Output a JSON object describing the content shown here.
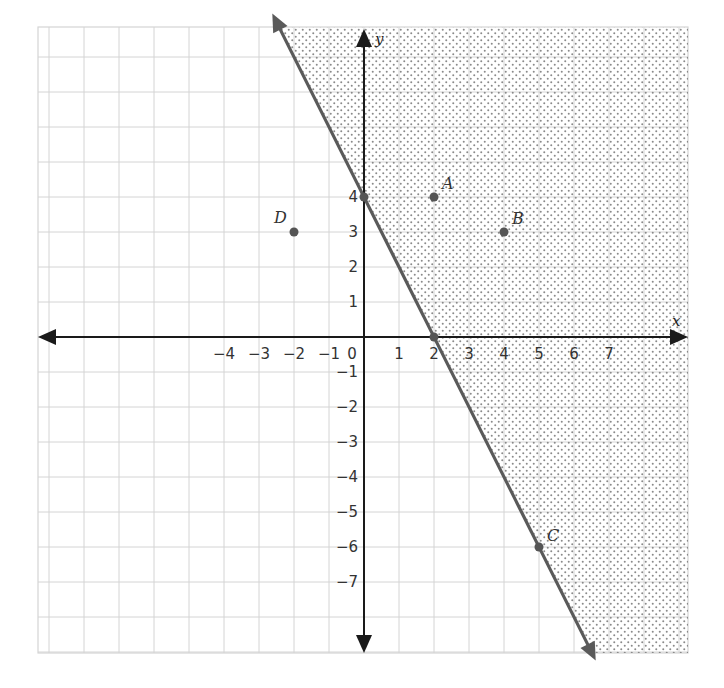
{
  "chart_data": {
    "type": "scatter",
    "title": "",
    "xlabel": "x",
    "ylabel": "y",
    "xlim": [
      -9.3,
      9.3
    ],
    "ylim": [
      -9.0,
      8.85
    ],
    "grid": true,
    "x_ticks": [
      -4,
      -3,
      -2,
      -1,
      0,
      1,
      2,
      3,
      4,
      5,
      6,
      7
    ],
    "y_ticks": [
      -7,
      -6,
      -5,
      -4,
      -3,
      -2,
      -1,
      1,
      2,
      3,
      4
    ],
    "boundary_line": {
      "equation": "y = -2x + 4",
      "slope": -2,
      "intercept": 4,
      "style": "solid",
      "arrows": "both",
      "color": "#5a5a5a"
    },
    "shaded_region": {
      "inequality": "y >= -2x + 4",
      "side": "right/above the line",
      "pattern": "dots"
    },
    "points": [
      {
        "label": "A",
        "x": 2,
        "y": 4
      },
      {
        "label": "B",
        "x": 4,
        "y": 3
      },
      {
        "label": "C",
        "x": 5,
        "y": -6
      },
      {
        "label": "D",
        "x": -2,
        "y": 3
      },
      {
        "label": "",
        "x": 0,
        "y": 4
      },
      {
        "label": "",
        "x": 2,
        "y": 0
      }
    ]
  },
  "labels": {
    "x_axis": "x",
    "y_axis": "y"
  },
  "colors": {
    "grid": "#d4d4d4",
    "axis": "#1a1a1a",
    "line": "#5a5a5a",
    "points": "#555555",
    "dots": "#8a8a8a"
  }
}
